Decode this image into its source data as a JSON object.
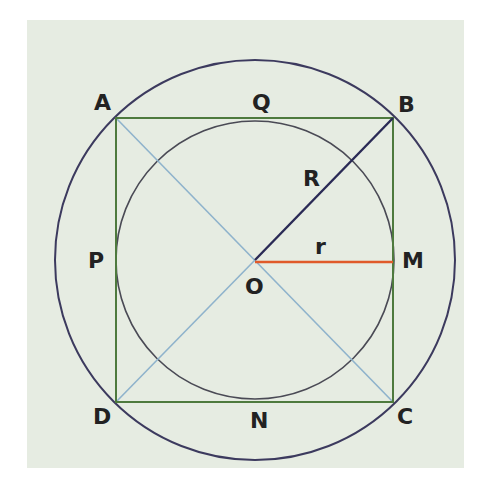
{
  "diagram": {
    "colors": {
      "panel_background": "#e6ece2",
      "outer_circle": "#3c3a5e",
      "inner_circle": "#4a4a55",
      "square": "#4e7a3e",
      "diagonals": "#8fb3cc",
      "radius_R": "#2a2a55",
      "radius_r": "#e05a2a",
      "label_text": "#222222"
    },
    "points": {
      "A": "A",
      "B": "B",
      "C": "C",
      "D": "D",
      "O": "O",
      "P": "P",
      "Q": "Q",
      "M": "M",
      "N": "N"
    },
    "segment_labels": {
      "R": "R",
      "r": "r"
    },
    "relations": {
      "square": "ABCD",
      "outer_circle": "circumscribed circle (radius R)",
      "inner_circle": "inscribed circle (radius r)",
      "tangent_points": [
        "P",
        "Q",
        "M",
        "N"
      ],
      "radius_R_segment": "OB",
      "radius_r_segment": "OM"
    }
  }
}
